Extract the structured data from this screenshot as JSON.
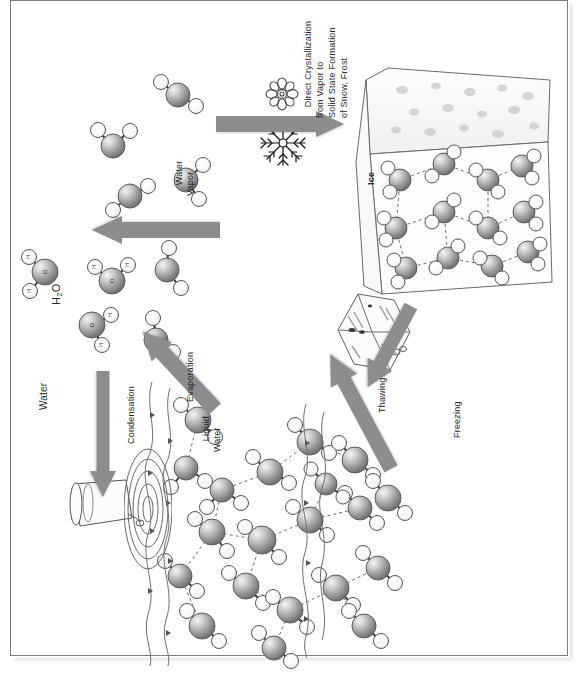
{
  "figure": {
    "orientation": "rotated-90",
    "frame_color": "#7d7d7d",
    "arrow_color": "#8d8d8d",
    "oxygen_color": "#9a9a9a",
    "hydrogen_color": "#ffffff"
  },
  "labels": {
    "h2o": "H",
    "h2o_sub": "2",
    "h2o_tail": "O",
    "water": "Water",
    "water_vapor": "Water\nVapor",
    "liquid_water": "Liquid\nWater",
    "ice": "Ice",
    "evaporation": "Evaporation",
    "condensation": "Condensation",
    "freezing": "Freezing",
    "thawing": "Thawing",
    "direct_crystallization": "Direct Crystallization\nfrom Vapor to\nSolid State Formation\nof Snow, Frost"
  },
  "arrows": [
    {
      "name": "deposition",
      "label": "Direct Crystallization from Vapor to Solid State Formation of Snow, Frost",
      "direction": "right"
    },
    {
      "name": "sublimation",
      "label": "",
      "direction": "left"
    },
    {
      "name": "evaporation",
      "label": "Evaporation",
      "direction": "up-left"
    },
    {
      "name": "condensation",
      "label": "Condensation",
      "direction": "down"
    },
    {
      "name": "freezing",
      "label": "Freezing",
      "direction": "up-right"
    },
    {
      "name": "thawing",
      "label": "Thawing",
      "direction": "down-left"
    }
  ],
  "regions": [
    {
      "name": "water-vapor-region",
      "label": "Water Vapor"
    },
    {
      "name": "liquid-water-region",
      "label": "Liquid Water"
    },
    {
      "name": "ice-region",
      "label": "Ice"
    }
  ],
  "icons": {
    "snowflake_outline": "snowflake-outline-icon",
    "snowflake_solid": "snowflake-solid-icon",
    "ice_crystal": "ice-crystal-icon",
    "water_glass": "water-glass-icon",
    "ripples": "water-ripple-icon"
  }
}
